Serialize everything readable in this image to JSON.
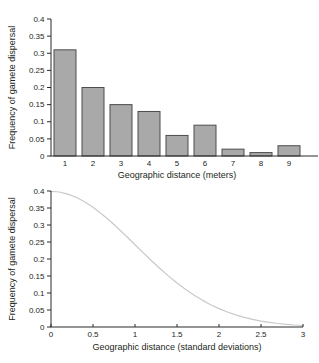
{
  "page": {
    "background": "#ffffff"
  },
  "colors": {
    "axis": "#2a2a2a",
    "text": "#231f20",
    "bar_fill": "#a9a9a9",
    "bar_stroke": "#4d4d4d",
    "curve": "#c9c9c9"
  },
  "chart_data": [
    {
      "type": "bar",
      "title": "",
      "categories": [
        "1",
        "2",
        "3",
        "4",
        "5",
        "6",
        "7",
        "8",
        "9"
      ],
      "values": [
        0.31,
        0.2,
        0.15,
        0.13,
        0.06,
        0.09,
        0.02,
        0.01,
        0.03
      ],
      "xlabel": "Geographic distance (meters)",
      "ylabel": "Frequency of gamete dispersal",
      "ylim": [
        0,
        0.4
      ],
      "yticks": {
        "values": [
          0,
          0.05,
          0.1,
          0.15,
          0.2,
          0.25,
          0.3,
          0.35,
          0.4
        ],
        "labels": [
          "0",
          "0.05",
          "0.1",
          "0.15",
          "0.2",
          "0.25",
          "0.3",
          "0.35",
          "0.4"
        ]
      },
      "grid": false,
      "legend": "none"
    },
    {
      "type": "line",
      "title": "",
      "x": [
        0,
        0.1,
        0.2,
        0.3,
        0.4,
        0.5,
        0.6,
        0.7,
        0.8,
        0.9,
        1.0,
        1.1,
        1.2,
        1.3,
        1.4,
        1.5,
        1.6,
        1.7,
        1.8,
        1.9,
        2.0,
        2.1,
        2.2,
        2.3,
        2.4,
        2.5,
        2.6,
        2.7,
        2.8,
        2.9,
        3.0
      ],
      "y": [
        0.3989,
        0.397,
        0.391,
        0.3814,
        0.3683,
        0.3521,
        0.3332,
        0.3123,
        0.2897,
        0.2661,
        0.242,
        0.2179,
        0.1942,
        0.1714,
        0.1497,
        0.1295,
        0.1109,
        0.094,
        0.079,
        0.0656,
        0.054,
        0.044,
        0.0355,
        0.0283,
        0.0224,
        0.0175,
        0.0136,
        0.0104,
        0.0079,
        0.006,
        0.0044
      ],
      "xlabel": "Geographic distance (standard deviations)",
      "ylabel": "Frequency of gamete dispersal",
      "xlim": [
        0,
        3
      ],
      "ylim": [
        0,
        0.4
      ],
      "xticks": {
        "values": [
          0,
          0.5,
          1,
          1.5,
          2,
          2.5,
          3
        ],
        "labels": [
          "0",
          "0.5",
          "1",
          "1.5",
          "2",
          "2.5",
          "3"
        ]
      },
      "yticks": {
        "values": [
          0,
          0.05,
          0.1,
          0.15,
          0.2,
          0.25,
          0.3,
          0.35,
          0.4
        ],
        "labels": [
          "0",
          "0.05",
          "0.1",
          "0.15",
          "0.2",
          "0.25",
          "0.3",
          "0.35",
          "0.4"
        ]
      },
      "grid": false,
      "legend": "none"
    }
  ]
}
